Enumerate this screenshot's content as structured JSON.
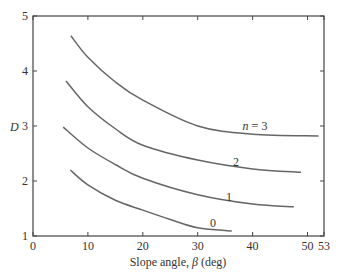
{
  "chart_data": {
    "type": "line",
    "title": "",
    "xlabel": "Slope angle, β (deg)",
    "ylabel": "D",
    "xlim": [
      0,
      53
    ],
    "ylim": [
      1,
      5
    ],
    "xticks": [
      0,
      10,
      20,
      30,
      40,
      50,
      53
    ],
    "yticks": [
      1,
      2,
      3,
      4,
      5
    ],
    "grid": false,
    "legend": "inline labels",
    "series": [
      {
        "name": "n = 3",
        "label": "n = 3",
        "x": [
          6.9,
          10,
          15,
          20,
          30,
          40,
          52
        ],
        "values": [
          4.64,
          4.25,
          3.8,
          3.47,
          3.0,
          2.85,
          2.82
        ]
      },
      {
        "name": "2",
        "label": "2",
        "x": [
          6,
          10,
          15,
          20,
          30,
          40,
          48.8
        ],
        "values": [
          3.82,
          3.35,
          2.95,
          2.65,
          2.38,
          2.22,
          2.16
        ]
      },
      {
        "name": "1",
        "label": "1",
        "x": [
          5.5,
          10,
          15,
          20,
          30,
          40,
          47.5
        ],
        "values": [
          2.98,
          2.6,
          2.3,
          2.05,
          1.75,
          1.58,
          1.53
        ]
      },
      {
        "name": "0",
        "label": "0",
        "x": [
          6.8,
          10,
          15,
          20,
          25,
          30,
          36.2
        ],
        "values": [
          2.2,
          1.93,
          1.65,
          1.47,
          1.3,
          1.15,
          1.09
        ]
      }
    ]
  },
  "axis": {
    "xlabel_prefix": "Slope angle, ",
    "xlabel_symbol": "β",
    "xlabel_suffix": " (deg)",
    "ylabel": "D"
  },
  "labels": {
    "n3": "n = 3",
    "n2": "2",
    "n1": "1",
    "n0": "0"
  }
}
